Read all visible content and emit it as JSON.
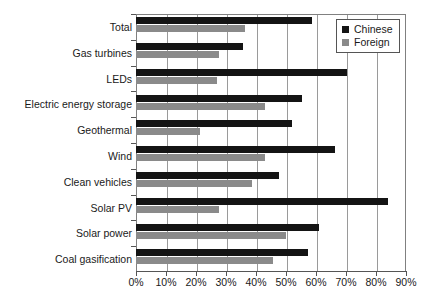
{
  "chart_data": {
    "type": "bar",
    "orientation": "horizontal",
    "title": "",
    "xlabel": "",
    "ylabel": "",
    "xlim": [
      0,
      90
    ],
    "xticks": [
      "0%",
      "10%",
      "20%",
      "30%",
      "40%",
      "50%",
      "60%",
      "70%",
      "80%",
      "90%"
    ],
    "xtick_values": [
      0,
      10,
      20,
      30,
      40,
      50,
      60,
      70,
      80,
      90
    ],
    "grid": "vertical",
    "legend_position": "top-right-inside",
    "categories": [
      "Total",
      "Gas turbines",
      "LEDs",
      "Electric energy storage",
      "Geothermal",
      "Wind",
      "Clean vehicles",
      "Solar PV",
      "Solar power",
      "Coal gasification"
    ],
    "series": [
      {
        "name": "Chinese",
        "color": "#141414",
        "values": [
          58.7,
          35.7,
          70.3,
          55.3,
          52.0,
          66.3,
          47.7,
          84.0,
          61.0,
          57.3
        ]
      },
      {
        "name": "Foreign",
        "color": "#8a8a8a",
        "values": [
          36.3,
          27.7,
          27.0,
          43.0,
          21.3,
          43.0,
          38.7,
          27.7,
          50.0,
          45.7
        ]
      }
    ]
  },
  "legend": {
    "items": [
      {
        "label": "Chinese",
        "swatch": "black-square-icon"
      },
      {
        "label": "Foreign",
        "swatch": "gray-square-icon"
      }
    ]
  }
}
